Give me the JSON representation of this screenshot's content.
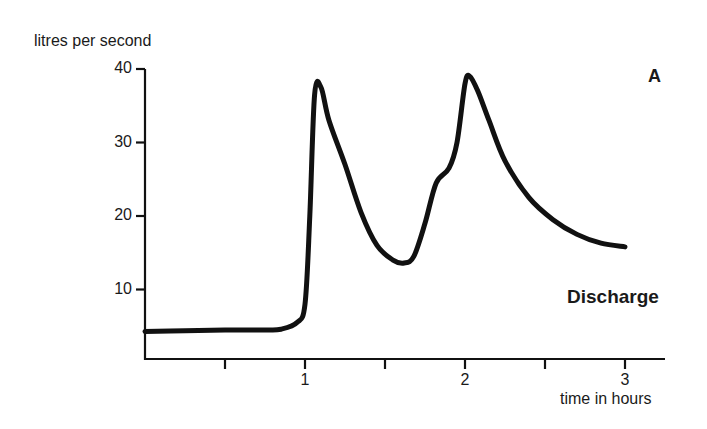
{
  "chart_data": {
    "type": "line",
    "title": "",
    "panel_label": "A",
    "series_label": "Discharge",
    "xlabel": "time in hours",
    "ylabel": "litres per second",
    "xlim": [
      0,
      3.25
    ],
    "ylim": [
      0,
      40
    ],
    "x_ticks": [
      0.5,
      1,
      1.5,
      2,
      2.5,
      3
    ],
    "x_tick_labels": [
      "",
      "1",
      "",
      "2",
      "",
      "3"
    ],
    "y_ticks": [
      10,
      20,
      30,
      40
    ],
    "y_tick_labels": [
      "10",
      "20",
      "30",
      "40"
    ],
    "grid": false,
    "series": [
      {
        "name": "Discharge",
        "x": [
          0,
          0.25,
          0.5,
          0.75,
          0.85,
          0.95,
          1.0,
          1.03,
          1.06,
          1.1,
          1.15,
          1.25,
          1.35,
          1.45,
          1.55,
          1.62,
          1.68,
          1.75,
          1.82,
          1.9,
          1.95,
          2.0,
          2.03,
          2.08,
          2.15,
          2.25,
          2.4,
          2.55,
          2.7,
          2.85,
          3.0
        ],
        "values": [
          4.3,
          4.4,
          4.5,
          4.5,
          4.6,
          5.5,
          8.0,
          20.0,
          36.5,
          37.5,
          33.0,
          27.0,
          20.5,
          16.0,
          14.0,
          13.6,
          14.5,
          19.0,
          24.5,
          26.5,
          30.0,
          38.0,
          39.0,
          37.0,
          33.0,
          27.5,
          22.5,
          19.5,
          17.5,
          16.3,
          15.8
        ]
      }
    ]
  }
}
